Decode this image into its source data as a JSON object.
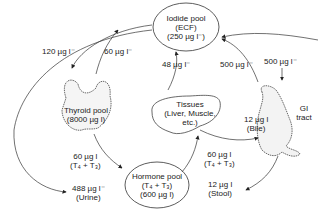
{
  "nodes": {
    "iodide_pool": {
      "line1": "Iodide pool",
      "line2": "(ECF)",
      "line3": "(250 µg l⁻)"
    },
    "thyroid_pool": {
      "line1": "Thyroid pool",
      "line2": "(8000 µg l)"
    },
    "tissues": {
      "line1": "Tissues",
      "line2": "(Liver, Muscle,",
      "line3": "etc.)"
    },
    "gi_tract": {
      "line1": "GI",
      "line2": "tract"
    },
    "hormone_pool": {
      "line1": "Hormone pool",
      "line2": "(T₄ + T₃)",
      "line3": "(600 µg l)"
    }
  },
  "flows": {
    "iodide_to_thyroid": "120 µg l⁻",
    "thyroid_to_iodide": "60 µg l⁻",
    "tissues_to_iodide": "48 µg l⁻",
    "gi_to_iodide": "500 µg l⁻",
    "intake": "500 µg l⁻",
    "bile": {
      "line1": "12 µg l",
      "line2": "(Bile)"
    },
    "thyroid_to_hormone": {
      "line1": "60 µg l",
      "line2": "(T₄ + T₃)"
    },
    "hormone_to_tissues": {
      "line1": "60 µg l",
      "line2": "(T₄ + T₃)"
    },
    "urine": {
      "line1": "488 µg l⁻",
      "line2": "(Urine)"
    },
    "stool": {
      "line1": "12 µg l",
      "line2": "(Stool)"
    }
  }
}
